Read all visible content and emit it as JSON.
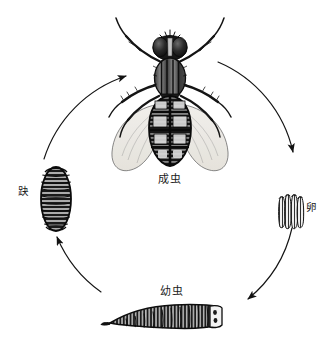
{
  "figure": {
    "background_color": "#ffffff",
    "ink_color": "#111111",
    "width": 333,
    "height": 352
  },
  "cycle": {
    "direction": "clockwise",
    "center_x": 166,
    "center_y": 186,
    "radius": 128,
    "stages": [
      {
        "id": "adult",
        "label": "成虫",
        "position": "top",
        "order": 1,
        "illustration": "housefly-dorsal-view"
      },
      {
        "id": "egg",
        "label": "卵",
        "position": "right",
        "order": 2,
        "illustration": "egg-cluster",
        "label_orientation": "vertical"
      },
      {
        "id": "larva",
        "label": "幼虫",
        "position": "bottom",
        "order": 3,
        "illustration": "maggot-lateral-view"
      },
      {
        "id": "pupa",
        "label": "趹",
        "position": "left",
        "order": 4,
        "illustration": "puparium-barrel",
        "label_orientation": "vertical"
      }
    ],
    "arrows": [
      {
        "id": "adult-to-egg",
        "from": "adult",
        "to": "egg",
        "head": "down-right"
      },
      {
        "id": "egg-to-larva",
        "from": "egg",
        "to": "larva",
        "head": "down-left"
      },
      {
        "id": "larva-to-pupa",
        "from": "larva",
        "to": "pupa",
        "head": "up-left"
      },
      {
        "id": "pupa-to-adult",
        "from": "pupa",
        "to": "adult",
        "head": "up-right"
      }
    ]
  }
}
